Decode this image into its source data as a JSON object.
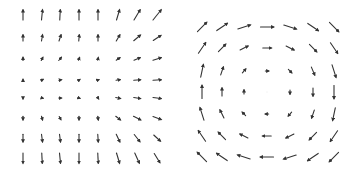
{
  "chart_data": [
    {
      "type": "quiver",
      "title": "",
      "xlabel": "",
      "ylabel": "",
      "grid": false,
      "description": "8x8 vector field; left columns point vertically (up in top half, down in bottom half), right columns tilt diagonally (up-right in top half, down-right in bottom half); magnitudes grow away from the middle rows.",
      "cols": 8,
      "rows": 8,
      "x_pixels": [
        23,
        42,
        60,
        79,
        98,
        118,
        137,
        157
      ],
      "y_pixels": [
        15,
        38,
        59,
        80,
        98,
        118,
        138,
        158
      ],
      "vectors": [
        [
          [
            0,
            -1.0
          ],
          [
            0.1,
            -1.0
          ],
          [
            0.05,
            -1.0
          ],
          [
            0,
            -1.0
          ],
          [
            0,
            -1.0
          ],
          [
            0.3,
            -1.0
          ],
          [
            0.6,
            -1.0
          ],
          [
            0.8,
            -1.0
          ]
        ],
        [
          [
            0,
            -0.6
          ],
          [
            0.1,
            -0.6
          ],
          [
            0.2,
            -0.6
          ],
          [
            0.05,
            -0.6
          ],
          [
            0,
            -0.6
          ],
          [
            0.35,
            -0.6
          ],
          [
            0.65,
            -0.55
          ],
          [
            0.75,
            -0.5
          ]
        ],
        [
          [
            0,
            -0.3
          ],
          [
            0.15,
            -0.3
          ],
          [
            0.25,
            -0.3
          ],
          [
            0.1,
            -0.25
          ],
          [
            0.05,
            -0.25
          ],
          [
            0.35,
            -0.25
          ],
          [
            0.6,
            -0.25
          ],
          [
            0.8,
            -0.25
          ]
        ],
        [
          [
            0,
            -0.1
          ],
          [
            0.2,
            -0.1
          ],
          [
            0.25,
            -0.05
          ],
          [
            0.15,
            -0.1
          ],
          [
            0.15,
            -0.05
          ],
          [
            0.4,
            -0.05
          ],
          [
            0.65,
            -0.05
          ],
          [
            0.8,
            -0.05
          ]
        ],
        [
          [
            0,
            0.15
          ],
          [
            0.2,
            0.05
          ],
          [
            0.25,
            0
          ],
          [
            0.15,
            0.05
          ],
          [
            0.1,
            0.15
          ],
          [
            0.45,
            0.1
          ],
          [
            0.65,
            0.1
          ],
          [
            0.8,
            0.1
          ]
        ],
        [
          [
            0,
            0.35
          ],
          [
            0.1,
            0.35
          ],
          [
            0.15,
            0.3
          ],
          [
            0,
            0.35
          ],
          [
            0.05,
            0.35
          ],
          [
            0.45,
            0.35
          ],
          [
            0.7,
            0.35
          ],
          [
            0.8,
            0.3
          ]
        ],
        [
          [
            0,
            0.75
          ],
          [
            0.1,
            0.75
          ],
          [
            0.1,
            0.75
          ],
          [
            0,
            0.75
          ],
          [
            0.05,
            0.75
          ],
          [
            0.35,
            0.75
          ],
          [
            0.55,
            0.7
          ],
          [
            0.65,
            0.6
          ]
        ],
        [
          [
            0,
            1.0
          ],
          [
            0.05,
            1.0
          ],
          [
            0.1,
            1.0
          ],
          [
            0,
            1.0
          ],
          [
            0.05,
            1.0
          ],
          [
            0.3,
            1.0
          ],
          [
            0.45,
            1.0
          ],
          [
            0.55,
            0.9
          ]
        ]
      ]
    },
    {
      "type": "quiver",
      "title": "",
      "xlabel": "",
      "ylabel": "",
      "grid": false,
      "description": "7x7 clockwise vortex (rotational) vector field; zero vector at center, magnitude increasing with radius.",
      "cols": 7,
      "rows": 7,
      "x_pixels": [
        202,
        222,
        244,
        267,
        290,
        313,
        334
      ],
      "y_pixels": [
        27,
        48,
        71,
        92,
        114,
        136,
        157
      ],
      "vectors": [
        [
          [
            0.7,
            -0.7
          ],
          [
            0.8,
            -0.55
          ],
          [
            0.95,
            -0.3
          ],
          [
            1.0,
            0
          ],
          [
            0.95,
            0.3
          ],
          [
            0.8,
            0.55
          ],
          [
            0.7,
            0.7
          ]
        ],
        [
          [
            0.55,
            -0.8
          ],
          [
            0.55,
            -0.55
          ],
          [
            0.6,
            -0.3
          ],
          [
            0.65,
            0
          ],
          [
            0.6,
            0.3
          ],
          [
            0.55,
            0.55
          ],
          [
            0.55,
            0.8
          ]
        ],
        [
          [
            0.2,
            -0.95
          ],
          [
            0.2,
            -0.6
          ],
          [
            0.25,
            -0.3
          ],
          [
            0.25,
            0
          ],
          [
            0.25,
            0.25
          ],
          [
            0.25,
            0.6
          ],
          [
            0.3,
            0.95
          ]
        ],
        [
          [
            0,
            -1.0
          ],
          [
            0,
            -0.6
          ],
          [
            0,
            -0.3
          ],
          [
            0,
            0
          ],
          [
            0,
            0.3
          ],
          [
            0,
            0.6
          ],
          [
            0,
            1.0
          ]
        ],
        [
          [
            -0.3,
            -0.95
          ],
          [
            -0.3,
            -0.6
          ],
          [
            -0.25,
            -0.25
          ],
          [
            -0.25,
            0
          ],
          [
            -0.25,
            0.3
          ],
          [
            -0.2,
            0.6
          ],
          [
            -0.2,
            0.95
          ]
        ],
        [
          [
            -0.55,
            -0.8
          ],
          [
            -0.55,
            -0.55
          ],
          [
            -0.6,
            -0.3
          ],
          [
            -0.65,
            0
          ],
          [
            -0.6,
            0.3
          ],
          [
            -0.55,
            0.55
          ],
          [
            -0.55,
            0.8
          ]
        ],
        [
          [
            -0.7,
            -0.7
          ],
          [
            -0.8,
            -0.55
          ],
          [
            -0.95,
            -0.3
          ],
          [
            -1.0,
            0
          ],
          [
            -0.95,
            0.3
          ],
          [
            -0.8,
            0.55
          ],
          [
            -0.7,
            0.7
          ]
        ]
      ]
    }
  ],
  "style": {
    "arrow_color": "#333333",
    "background": "#ffffff",
    "left_scale": 10,
    "right_scale": 13
  }
}
